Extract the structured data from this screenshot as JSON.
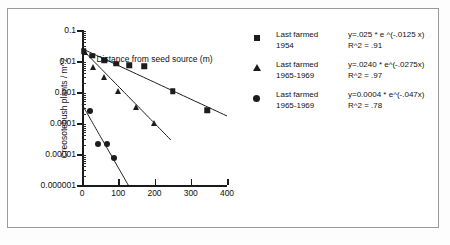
{
  "chart_data": {
    "type": "scatter",
    "title": "",
    "xlabel": "Distance from seed source (m)",
    "ylabel": "Creosotebush plants / m^2",
    "xlim": [
      0,
      400
    ],
    "ylim": [
      1e-06,
      0.1
    ],
    "yscale": "log",
    "xscale": "linear",
    "grid": false,
    "legend_position": "right",
    "xticks": [
      "0",
      "100",
      "200",
      "300",
      "400"
    ],
    "xtick_values": [
      0,
      100,
      200,
      300,
      400
    ],
    "yticks": [
      "0.1",
      "0.01",
      "0.001",
      "0.0001",
      "0.00001",
      "0.000001"
    ],
    "ytick_values": [
      0.1,
      0.01,
      0.001,
      0.0001,
      1e-05,
      1e-06
    ],
    "series": [
      {
        "name": "Last farmed 1954",
        "marker": "square",
        "color": "#1c1c1c",
        "equation": "y=.025 *  e ^(-.0125 x)",
        "r_squared": "R^2 = .91",
        "points": [
          {
            "x": 5,
            "y": 0.021
          },
          {
            "x": 28,
            "y": 0.0145
          },
          {
            "x": 62,
            "y": 0.0105
          },
          {
            "x": 95,
            "y": 0.0082
          },
          {
            "x": 130,
            "y": 0.0072
          },
          {
            "x": 172,
            "y": 0.0068
          },
          {
            "x": 250,
            "y": 0.00105
          },
          {
            "x": 345,
            "y": 0.00026
          }
        ],
        "fit": {
          "a": 0.025,
          "b": -0.0125,
          "x_start": 0,
          "x_end": 400
        }
      },
      {
        "name": "Last farmed 1965-1969",
        "marker": "triangle",
        "color": "#1c1c1c",
        "equation": "y=.0240 * e^(-.0275x)",
        "r_squared": "R^2 = .97",
        "points": [
          {
            "x": 8,
            "y": 0.0195
          },
          {
            "x": 30,
            "y": 0.0066
          },
          {
            "x": 62,
            "y": 0.0031
          },
          {
            "x": 98,
            "y": 0.00105
          },
          {
            "x": 150,
            "y": 0.00032
          },
          {
            "x": 198,
            "y": 0.0001
          }
        ],
        "fit": {
          "a": 0.024,
          "b": -0.0275,
          "x_start": 0,
          "x_end": 245
        }
      },
      {
        "name": "Last farmed 1965-1969",
        "marker": "circle",
        "color": "#1c1c1c",
        "equation": "y=0.0004 * e^(-.047x)",
        "r_squared": "R^2 = .78",
        "points": [
          {
            "x": 22,
            "y": 0.00024
          },
          {
            "x": 45,
            "y": 2.05e-05
          },
          {
            "x": 70,
            "y": 2.1e-05
          },
          {
            "x": 88,
            "y": 7.2e-06
          }
        ],
        "fit": {
          "a": 0.0004,
          "b": -0.047,
          "x_start": 0,
          "x_end": 128
        }
      }
    ]
  },
  "legend": {
    "entries": [
      {
        "marker_icon": "square-marker-icon",
        "label_line1": "Last farmed",
        "label_line2": "1954",
        "equation": "y=.025 *  e ^(-.0125 x)",
        "r_squared": "R^2 = .91"
      },
      {
        "marker_icon": "triangle-marker-icon",
        "label_line1": "Last farmed",
        "label_line2": "1965-1969",
        "equation": "y=.0240 * e^(-.0275x)",
        "r_squared": "R^2 = .97"
      },
      {
        "marker_icon": "circle-marker-icon",
        "label_line1": "Last farmed",
        "label_line2": "1965-1969",
        "equation": "y=0.0004 * e^(-.047x)",
        "r_squared": "R^2 = .78"
      }
    ]
  },
  "axes": {
    "x_title": "Distance from seed source (m)",
    "y_title": "Creosotebush plants / m^2"
  }
}
